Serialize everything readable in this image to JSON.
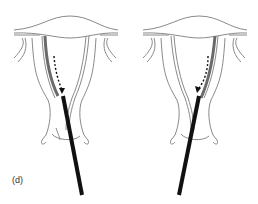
{
  "figure": {
    "label": "(d)",
    "panels": [
      {
        "id": "left",
        "highlighted_side": "left",
        "arrow": "dashed-curved-down",
        "instrument": "probe"
      },
      {
        "id": "right",
        "highlighted_side": "right",
        "arrow": "dashed-curved-down",
        "instrument": "probe"
      }
    ]
  },
  "colors": {
    "outline": "#8a8a8a",
    "highlight": "#6a6a6a",
    "instrument": "#111111",
    "background": "#ffffff"
  }
}
